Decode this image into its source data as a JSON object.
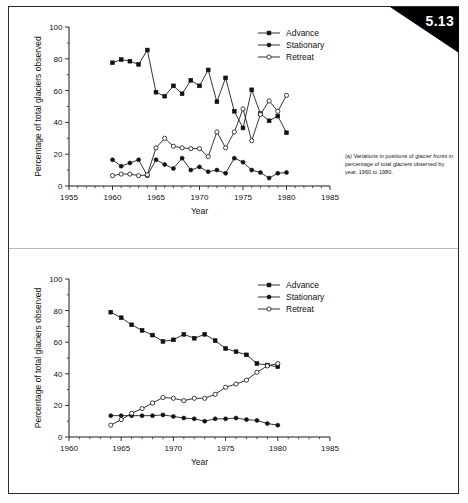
{
  "figure": {
    "badge_number": "5.13",
    "page_background": "#ffffff",
    "ink_color": "#111111"
  },
  "panel_a": {
    "caption": "(a) Variations in positions of glacier fronts in percentage of total glaciers observed by year, 1960 to 1980.",
    "legend": [
      {
        "label": "Advance",
        "marker": "filled-square"
      },
      {
        "label": "Stationary",
        "marker": "filled-circle"
      },
      {
        "label": "Retreat",
        "marker": "open-circle"
      }
    ]
  },
  "panel_b": {
    "caption": "(b) Variations in positions of glacier fronts in percentage of total glaciers observed, 5-yr moving averages, 1965 to 1980",
    "legend": [
      {
        "label": "Advance",
        "marker": "filled-square"
      },
      {
        "label": "Stationary",
        "marker": "filled-circle"
      },
      {
        "label": "Retreat",
        "marker": "open-circle"
      }
    ]
  },
  "chart_data": [
    {
      "id": "a",
      "type": "line",
      "title": "",
      "xlabel": "Year",
      "ylabel": "Percentage of total glaciers observed",
      "xlim": [
        1955,
        1985
      ],
      "ylim": [
        0,
        100
      ],
      "xticks": [
        1955,
        1960,
        1965,
        1970,
        1975,
        1980,
        1985
      ],
      "yticks": [
        0,
        20,
        40,
        60,
        80,
        100
      ],
      "minor_x_step": 1,
      "minor_y_step": 10,
      "grid": false,
      "legend_position": "top-right",
      "x": [
        1960,
        1961,
        1962,
        1963,
        1964,
        1965,
        1966,
        1967,
        1968,
        1969,
        1970,
        1971,
        1972,
        1973,
        1974,
        1975,
        1976,
        1977,
        1978,
        1979,
        1980
      ],
      "series": [
        {
          "name": "Advance",
          "marker": "filled-square",
          "values": [
            77.5,
            79.5,
            78.5,
            76.5,
            85.5,
            59,
            56.5,
            63,
            58,
            66.5,
            63,
            73,
            53,
            68,
            47,
            36.5,
            60.5,
            45.5,
            41,
            44,
            33.5
          ]
        },
        {
          "name": "Stationary",
          "marker": "filled-circle",
          "values": [
            16.5,
            12.5,
            14.5,
            16.5,
            6.5,
            16.5,
            13.5,
            11,
            17.5,
            10,
            12,
            9,
            10,
            8,
            17.5,
            15,
            10,
            8.5,
            5,
            8,
            8.5
          ]
        },
        {
          "name": "Retreat",
          "marker": "open-circle",
          "values": [
            6.5,
            7.5,
            7.5,
            6.5,
            7,
            24,
            30,
            25,
            24,
            23.5,
            23.5,
            18.5,
            34,
            24,
            34,
            48.5,
            28.5,
            45,
            53.5,
            47,
            57
          ]
        }
      ]
    },
    {
      "id": "b",
      "type": "line",
      "title": "",
      "xlabel": "Year",
      "ylabel": "Percentage of total glaciers observed",
      "xlim": [
        1960,
        1985
      ],
      "ylim": [
        0,
        100
      ],
      "xticks": [
        1960,
        1965,
        1970,
        1975,
        1980,
        1985
      ],
      "yticks": [
        0,
        20,
        40,
        60,
        80,
        100
      ],
      "minor_x_step": 1,
      "minor_y_step": 10,
      "grid": false,
      "legend_position": "top-right",
      "x": [
        1964,
        1965,
        1966,
        1967,
        1968,
        1969,
        1970,
        1971,
        1972,
        1973,
        1974,
        1975,
        1976,
        1977,
        1978,
        1979,
        1980
      ],
      "series": [
        {
          "name": "Advance",
          "marker": "filled-square",
          "values": [
            79,
            75.5,
            71,
            67.5,
            64.5,
            60.5,
            61.5,
            65,
            62.5,
            65,
            61,
            56,
            54,
            52,
            46.5,
            45.5,
            44.5
          ]
        },
        {
          "name": "Stationary",
          "marker": "filled-circle",
          "values": [
            13.5,
            13.5,
            13.5,
            13.5,
            13.5,
            14,
            13,
            12,
            11.5,
            10,
            11.5,
            11.5,
            12,
            11,
            10.5,
            8.5,
            7.5
          ]
        },
        {
          "name": "Retreat",
          "marker": "open-circle",
          "values": [
            7.5,
            11,
            15,
            18,
            21.5,
            25,
            24.5,
            23,
            24.5,
            24.5,
            27,
            31.5,
            33.5,
            36,
            41,
            45,
            46.5
          ]
        }
      ]
    }
  ]
}
